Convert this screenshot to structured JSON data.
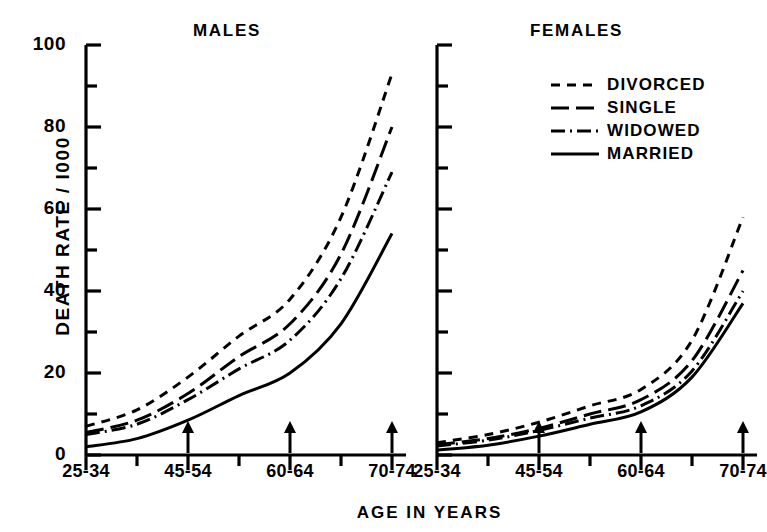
{
  "figure": {
    "ylabel": "DEATH RATE / I000",
    "xlabel": "AGE IN YEARS",
    "panels": [
      {
        "key": "males",
        "title": "MALES"
      },
      {
        "key": "females",
        "title": "FEMALES"
      }
    ],
    "y_tick_labels": [
      "100",
      "80",
      "60",
      "40",
      "20",
      "0"
    ],
    "x_tick_labels": [
      "25-34",
      "45-54",
      "60-64",
      "70-74"
    ]
  },
  "legend": {
    "position": "inside-females-panel-top-right",
    "items": [
      {
        "label": "DIVORCED",
        "style": "short-dash",
        "dasharray": "9,7"
      },
      {
        "label": "SINGLE",
        "style": "long-dash",
        "dasharray": "18,7"
      },
      {
        "label": "WIDOWED",
        "style": "dash-dot",
        "dasharray": "14,5,2,5"
      },
      {
        "label": "MARRIED",
        "style": "solid",
        "dasharray": "none"
      }
    ]
  },
  "colors": {
    "ink": "#000000",
    "background": "#ffffff"
  },
  "chart_data": {
    "type": "line",
    "xlabel": "AGE IN YEARS",
    "ylabel": "DEATH RATE / I000",
    "ylim": [
      0,
      100
    ],
    "y_ticks_major": [
      0,
      20,
      40,
      60,
      80,
      100
    ],
    "y_ticks_minor": [
      10,
      30,
      50,
      70,
      90
    ],
    "grid": false,
    "legend_position": "inside-females-panel-top-right",
    "categories": [
      "25-34",
      "35-44",
      "45-54",
      "55-59",
      "60-64",
      "65-69",
      "70-74"
    ],
    "x_labeled_categories": [
      "25-34",
      "45-54",
      "60-64",
      "70-74"
    ],
    "x_arrow_categories": [
      "45-54",
      "60-64",
      "70-74"
    ],
    "panels": [
      {
        "name": "MALES",
        "series": [
          {
            "name": "DIVORCED",
            "style": "short-dash",
            "values": [
              7.0,
              11.0,
              19.0,
              29.0,
              38.0,
              58.0,
              93.0
            ]
          },
          {
            "name": "SINGLE",
            "style": "long-dash",
            "values": [
              5.5,
              8.5,
              15.0,
              24.0,
              32.0,
              49.0,
              80.0
            ]
          },
          {
            "name": "WIDOWED",
            "style": "dash-dot",
            "values": [
              5.0,
              7.5,
              13.5,
              21.0,
              28.0,
              43.0,
              69.0
            ]
          },
          {
            "name": "MARRIED",
            "style": "solid",
            "values": [
              2.0,
              4.0,
              8.5,
              14.5,
              20.0,
              32.0,
              54.0
            ]
          }
        ]
      },
      {
        "name": "FEMALES",
        "series": [
          {
            "name": "DIVORCED",
            "style": "short-dash",
            "values": [
              3.0,
              5.0,
              8.0,
              12.0,
              16.0,
              28.0,
              58.0
            ]
          },
          {
            "name": "SINGLE",
            "style": "long-dash",
            "values": [
              2.5,
              4.0,
              6.5,
              10.0,
              13.5,
              23.0,
              45.0
            ]
          },
          {
            "name": "WIDOWED",
            "style": "dash-dot",
            "values": [
              2.2,
              3.6,
              6.0,
              9.0,
              12.0,
              20.5,
              40.0
            ]
          },
          {
            "name": "MARRIED",
            "style": "solid",
            "values": [
              1.2,
              2.4,
              4.6,
              7.5,
              10.5,
              19.0,
              37.0
            ]
          }
        ]
      }
    ]
  }
}
